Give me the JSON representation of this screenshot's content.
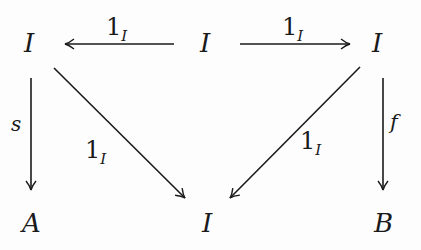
{
  "diagram": {
    "type": "commutative-diagram",
    "nodes": [
      {
        "id": "top-left",
        "label": "I"
      },
      {
        "id": "top-center",
        "label": "I"
      },
      {
        "id": "top-right",
        "label": "I"
      },
      {
        "id": "bottom-left",
        "label": "A"
      },
      {
        "id": "bottom-center",
        "label": "I"
      },
      {
        "id": "bottom-right",
        "label": "B"
      }
    ],
    "edges": [
      {
        "id": "tc-to-tl",
        "from": "top-center",
        "to": "top-left",
        "label_main": "1",
        "label_sub": "I"
      },
      {
        "id": "tc-to-tr",
        "from": "top-center",
        "to": "top-right",
        "label_main": "1",
        "label_sub": "I"
      },
      {
        "id": "tl-to-bl",
        "from": "top-left",
        "to": "bottom-left",
        "label_main": "s",
        "label_sub": ""
      },
      {
        "id": "tl-to-bc",
        "from": "top-left",
        "to": "bottom-center",
        "label_main": "1",
        "label_sub": "I"
      },
      {
        "id": "tr-to-bc",
        "from": "top-right",
        "to": "bottom-center",
        "label_main": "1",
        "label_sub": "I"
      },
      {
        "id": "tr-to-br",
        "from": "top-right",
        "to": "bottom-right",
        "label_main": "f",
        "label_sub": ""
      }
    ]
  }
}
